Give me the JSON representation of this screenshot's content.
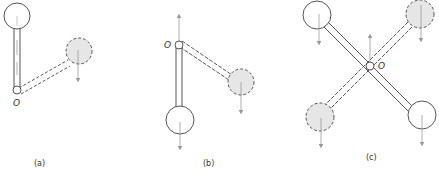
{
  "figure": {
    "panels": [
      {
        "id": "a",
        "caption": "(a)",
        "pivot_label": "O"
      },
      {
        "id": "b",
        "caption": "(b)",
        "pivot_label": "O"
      },
      {
        "id": "c",
        "caption": "(c)",
        "pivot_label": "O"
      }
    ]
  },
  "colors": {
    "stroke": "#555555",
    "rod_fill": "#ffffff",
    "dashed_fill": "#e6e6e6",
    "arrow": "#999999",
    "caption": "#333333"
  },
  "legend": {
    "solid_mass": "solid outline circle",
    "dashed_mass": "dashed outline shaded circle"
  }
}
